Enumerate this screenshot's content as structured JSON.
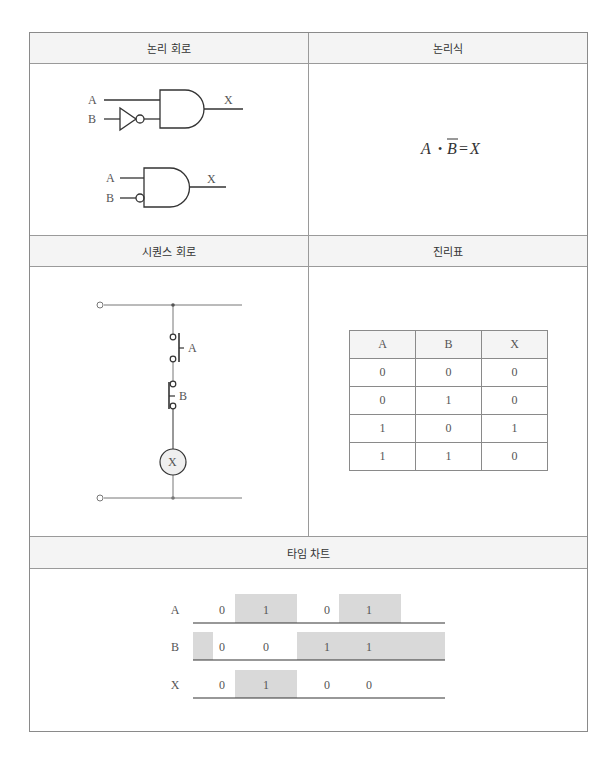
{
  "sections": {
    "logic_circuit": {
      "title": "논리 회로"
    },
    "logic_expression": {
      "title": "논리식",
      "expr_a": "A",
      "expr_dot": "•",
      "expr_b": "B",
      "expr_eq": "=",
      "expr_x": "X"
    },
    "sequence_circuit": {
      "title": "시퀀스 회로"
    },
    "truth_table_section": {
      "title": "진리표"
    },
    "timing_chart": {
      "title": "타임 차트"
    }
  },
  "logic_circuit": {
    "gate1": {
      "input_a": "A",
      "input_b": "B",
      "output": "X"
    },
    "gate2": {
      "input_a": "A",
      "input_b": "B",
      "output": "X"
    }
  },
  "sequence_circuit": {
    "switch_a": "A",
    "switch_b": "B",
    "coil": "X"
  },
  "truth_table": {
    "headers": [
      "A",
      "B",
      "X"
    ],
    "rows": [
      [
        "0",
        "0",
        "0"
      ],
      [
        "0",
        "1",
        "0"
      ],
      [
        "1",
        "0",
        "1"
      ],
      [
        "1",
        "1",
        "0"
      ]
    ]
  },
  "timing": {
    "rows": [
      {
        "label": "A",
        "values": [
          "0",
          "1",
          "0",
          "1"
        ]
      },
      {
        "label": "B",
        "values": [
          "0",
          "0",
          "1",
          "1"
        ]
      },
      {
        "label": "X",
        "values": [
          "0",
          "1",
          "0",
          "0"
        ]
      }
    ]
  },
  "colors": {
    "line": "#333333",
    "shade": "#d9d9d9",
    "header_bg": "#f4f4f4",
    "border": "#8a8a8a"
  }
}
